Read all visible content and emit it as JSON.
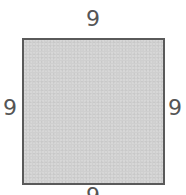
{
  "figure": {
    "shape": "square",
    "colors": {
      "fill": "#cfcfcf",
      "border": "#5a5a5a",
      "label": "#555555"
    },
    "side_labels": {
      "top": "9",
      "left": "9",
      "right": "9",
      "bottom": "9"
    }
  }
}
